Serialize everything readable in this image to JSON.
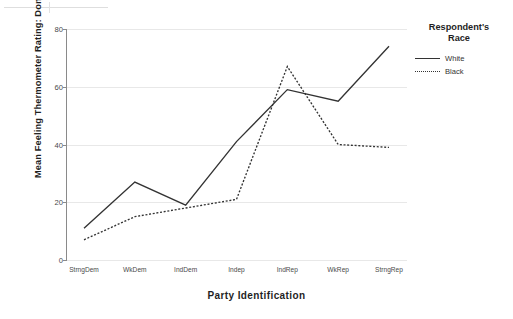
{
  "chart_data": {
    "type": "line",
    "title": "",
    "xlabel": "Party Identification",
    "ylabel": "Mean Feeling Thermometer Rating: Donald Trump",
    "categories": [
      "StrngDem",
      "WkDem",
      "IndDem",
      "Indep",
      "IndRep",
      "WkRep",
      "StrngRep"
    ],
    "series": [
      {
        "name": "White",
        "style": "solid",
        "values": [
          11,
          27,
          19,
          41,
          59,
          55,
          74
        ]
      },
      {
        "name": "Black",
        "style": "dotted",
        "values": [
          7,
          15,
          18,
          21,
          67,
          40,
          39
        ]
      }
    ],
    "ylim": [
      0,
      80
    ],
    "yticks": [
      0,
      20,
      40,
      60,
      80
    ],
    "ytick_labels": [
      "0",
      "20",
      "40",
      "60",
      "80"
    ],
    "grid": "horizontal",
    "legend_position": "right",
    "legend_title_lines": [
      "Respondent's",
      "Race"
    ],
    "colors": {
      "line": "#333333",
      "axis": "#8a8a8a",
      "grid": "#e8e8e8",
      "text": "#1f1f1f"
    }
  },
  "legend": {
    "title_line1": "Respondent's",
    "title_line2": "Race",
    "entries": [
      {
        "label": "White"
      },
      {
        "label": "Black"
      }
    ]
  }
}
